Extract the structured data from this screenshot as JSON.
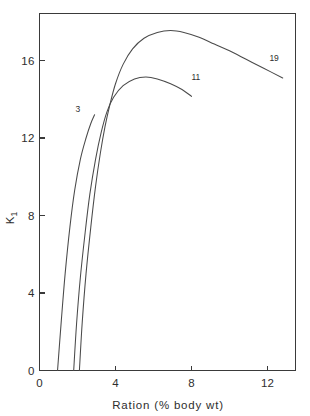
{
  "chart_data": {
    "type": "line",
    "title": "",
    "xlabel": "Ration  (% body wt)",
    "ylabel": "K",
    "ylabel_subscript": "1",
    "xlim": [
      0,
      13.7
    ],
    "ylim": [
      0,
      18.6
    ],
    "xticks": [
      0,
      4,
      8,
      12
    ],
    "xtick_labels": [
      "0",
      "4",
      "8",
      "12"
    ],
    "yticks": [
      0,
      4,
      8,
      12,
      16
    ],
    "ytick_labels": [
      "0",
      "4",
      "8",
      "12",
      "16"
    ],
    "grid": false,
    "legend": "inline-end-labels",
    "line_color": "#4a4a4a",
    "axis_color": "#3a3a3a",
    "background": "#ffffff",
    "series": [
      {
        "name": "3",
        "label": "3",
        "label_x": 1.9,
        "label_y": 13.35,
        "points": [
          [
            0.95,
            0.0
          ],
          [
            1.15,
            2.6
          ],
          [
            1.35,
            5.0
          ],
          [
            1.6,
            7.4
          ],
          [
            1.85,
            9.3
          ],
          [
            2.15,
            10.9
          ],
          [
            2.45,
            12.0
          ],
          [
            2.7,
            12.75
          ],
          [
            2.9,
            13.2
          ]
        ]
      },
      {
        "name": "11",
        "label": "11",
        "label_x": 8.0,
        "label_y": 15.0,
        "points": [
          [
            1.8,
            0.0
          ],
          [
            1.95,
            2.4
          ],
          [
            2.15,
            4.8
          ],
          [
            2.4,
            7.1
          ],
          [
            2.65,
            9.1
          ],
          [
            2.95,
            10.9
          ],
          [
            3.25,
            12.3
          ],
          [
            3.55,
            13.35
          ],
          [
            3.9,
            14.1
          ],
          [
            4.4,
            14.7
          ],
          [
            5.0,
            15.05
          ],
          [
            5.6,
            15.15
          ],
          [
            6.2,
            15.05
          ],
          [
            6.9,
            14.8
          ],
          [
            7.5,
            14.5
          ],
          [
            8.0,
            14.15
          ]
        ]
      },
      {
        "name": "19",
        "label": "19",
        "label_x": 12.1,
        "label_y": 16.0,
        "points": [
          [
            2.1,
            0.0
          ],
          [
            2.25,
            2.5
          ],
          [
            2.45,
            5.0
          ],
          [
            2.7,
            7.4
          ],
          [
            2.95,
            9.5
          ],
          [
            3.2,
            11.2
          ],
          [
            3.45,
            12.6
          ],
          [
            3.7,
            13.7
          ],
          [
            4.0,
            14.8
          ],
          [
            4.4,
            15.8
          ],
          [
            4.9,
            16.6
          ],
          [
            5.5,
            17.15
          ],
          [
            6.2,
            17.45
          ],
          [
            6.9,
            17.55
          ],
          [
            7.6,
            17.45
          ],
          [
            8.4,
            17.2
          ],
          [
            9.2,
            16.85
          ],
          [
            10.0,
            16.5
          ],
          [
            10.9,
            16.05
          ],
          [
            11.8,
            15.6
          ],
          [
            12.8,
            15.1
          ]
        ]
      }
    ]
  }
}
